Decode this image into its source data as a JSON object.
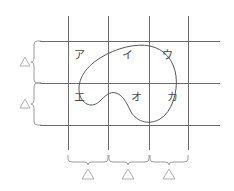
{
  "figure": {
    "type": "venn-grid-diagram",
    "background_color": "#ffffff",
    "grid_line_color": "#6b6b6b",
    "curve_color": "#555555",
    "brace_color": "#9a9a9a",
    "marker_color": "#b0b0b0",
    "label_color": "#4a4a4a",
    "grid": {
      "vertical_line_count": 4,
      "horizontal_line_count": 3,
      "vertical_line_x": [
        68,
        108,
        149,
        188
      ],
      "horizontal_line_y": [
        41,
        83,
        125
      ],
      "vertical_line_top": 16,
      "vertical_line_bottom": 150,
      "horizontal_line_left": 40,
      "horizontal_line_right": 220
    },
    "region_labels": [
      {
        "id": "region-a",
        "text": "ア",
        "x": 74,
        "y": 55,
        "row": 0,
        "col": 0
      },
      {
        "id": "region-i",
        "text": "イ",
        "x": 122,
        "y": 55,
        "row": 0,
        "col": 1
      },
      {
        "id": "region-u",
        "text": "ウ",
        "x": 162,
        "y": 55,
        "row": 0,
        "col": 2
      },
      {
        "id": "region-e",
        "text": "エ",
        "x": 74,
        "y": 97,
        "row": 1,
        "col": 0
      },
      {
        "id": "region-o",
        "text": "オ",
        "x": 131,
        "y": 97,
        "row": 1,
        "col": 1
      },
      {
        "id": "region-ka",
        "text": "カ",
        "x": 167,
        "y": 97,
        "row": 1,
        "col": 2
      }
    ],
    "left_braces": [
      {
        "id": "left-brace-upper",
        "marker": "△",
        "span_top": 41,
        "span_bottom": 83,
        "marker_x": 25,
        "marker_y": 62
      },
      {
        "id": "left-brace-lower",
        "marker": "△",
        "span_top": 83,
        "span_bottom": 125,
        "marker_x": 25,
        "marker_y": 104
      }
    ],
    "bottom_braces": [
      {
        "id": "bottom-brace-1",
        "marker": "△",
        "span_left": 68,
        "span_right": 108,
        "marker_x": 88,
        "marker_y": 175
      },
      {
        "id": "bottom-brace-2",
        "marker": "△",
        "span_left": 108,
        "span_right": 149,
        "marker_x": 128,
        "marker_y": 175
      },
      {
        "id": "bottom-brace-3",
        "marker": "△",
        "span_left": 149,
        "span_right": 188,
        "marker_x": 169,
        "marker_y": 175
      }
    ],
    "closed_curve": {
      "id": "region-outline",
      "shape": "kidney-bean",
      "stroke_width": 1,
      "fill": "none",
      "path": "M 80 96 C 76 82 84 68 100 58 C 116 48 136 43 150 46 C 164 49 174 60 176 76 C 178 92 172 112 160 119 C 148 126 135 121 130 110 C 126 101 122 95 116 93 C 110 91 105 96 100 101 C 94 107 85 107 80 96 Z"
    }
  }
}
